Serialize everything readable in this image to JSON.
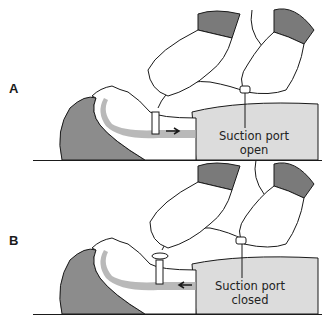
{
  "figure": {
    "panels": [
      {
        "id": "A",
        "letter": "A",
        "callout_line1": "Suction port",
        "callout_line2": "open",
        "airflow_direction": "outward"
      },
      {
        "id": "B",
        "letter": "B",
        "callout_line1": "Suction port",
        "callout_line2": "closed",
        "airflow_direction": "inward"
      }
    ],
    "colors": {
      "background": "#ffffff",
      "hair": "#8c8c8c",
      "sleeve": "#7a7a7a",
      "blanket": "#dcdcdc",
      "airway": "#a8a8a8",
      "line": "#1a1a1a",
      "glove": "#ffffff"
    }
  }
}
